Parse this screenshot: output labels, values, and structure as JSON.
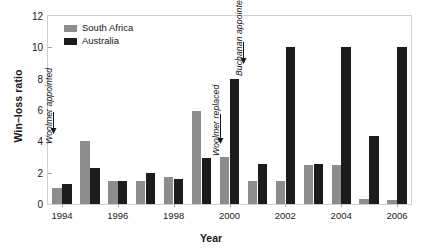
{
  "chart_data": {
    "type": "bar",
    "title": "Win–loss ratio",
    "xlabel": "Year",
    "ylabel": "Win–loss ratio",
    "categories": [
      1994,
      1995,
      1996,
      1997,
      1998,
      1999,
      2000,
      2001,
      2002,
      2003,
      2004,
      2005,
      2006
    ],
    "tick_labels": [
      "1994",
      "1996",
      "1998",
      "2000",
      "2002",
      "2004",
      "2006"
    ],
    "tick_years": [
      1994,
      1996,
      1998,
      2000,
      2002,
      2004,
      2006
    ],
    "ylim": [
      0,
      12
    ],
    "yticks": [
      0,
      2,
      4,
      6,
      8,
      10,
      12
    ],
    "grid": false,
    "legend_position": "top-left",
    "series": [
      {
        "name": "South Africa",
        "color": "#8d8d8d",
        "values": [
          1.0,
          4.0,
          1.5,
          1.45,
          1.7,
          5.95,
          3.0,
          1.45,
          1.45,
          2.5,
          2.5,
          0.35,
          0.25
        ]
      },
      {
        "name": "Australia",
        "color": "#1c1c1c",
        "values": [
          1.3,
          2.3,
          1.5,
          1.95,
          1.6,
          2.95,
          8.0,
          2.55,
          10.0,
          2.55,
          10.0,
          4.35,
          10.0
        ]
      }
    ],
    "annotations": [
      {
        "id": "woolmer-appointed",
        "text": "Woolmer appointed",
        "year": 1994,
        "arrow": "down"
      },
      {
        "id": "woolmer-replaced",
        "text": "Woolmer replaced",
        "year": 2000,
        "arrow": "down"
      },
      {
        "id": "buchanan-appointed",
        "text": "Buchanan appointed",
        "year": 2000,
        "arrow": "down"
      }
    ]
  },
  "legend": {
    "items": [
      {
        "label": "South Africa",
        "color": "#8d8d8d"
      },
      {
        "label": "Australia",
        "color": "#1c1c1c"
      }
    ]
  },
  "axes": {
    "x_title": "Year",
    "y_title": "Win–loss ratio"
  },
  "figure": {
    "title_fragment": ""
  }
}
